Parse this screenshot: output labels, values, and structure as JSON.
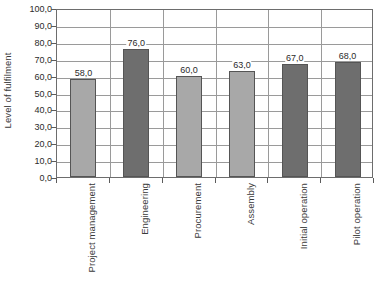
{
  "chart_data": {
    "type": "bar",
    "title": "",
    "xlabel": "",
    "ylabel": "Level of fulfilment",
    "ylim": [
      0,
      100
    ],
    "ytick_step": 10,
    "decimal_separator": ",",
    "grid": "horizontal-and-vertical",
    "legend": "none",
    "categories": [
      "Project management",
      "Engineering",
      "Procurement",
      "Assembly",
      "Initial operation",
      "Pilot operation"
    ],
    "values": [
      58,
      76,
      60,
      63,
      67,
      68
    ],
    "value_labels": [
      "58,0",
      "76,0",
      "60,0",
      "63,0",
      "67,0",
      "68,0"
    ],
    "bar_colors": [
      "#a8a8a8",
      "#6e6e6e",
      "#a8a8a8",
      "#a8a8a8",
      "#6e6e6e",
      "#6e6e6e"
    ],
    "ytick_labels": [
      "100,0",
      "90,0",
      "80,0",
      "70,0",
      "60,0",
      "50,0",
      "40,0",
      "30,0",
      "20,0",
      "10,0",
      "0,0"
    ],
    "ytick_values": [
      100,
      90,
      80,
      70,
      60,
      50,
      40,
      30,
      20,
      10,
      0
    ],
    "colors": {
      "bar_light": "#a8a8a8",
      "bar_dark": "#6e6e6e",
      "bar_outline": "#555555",
      "gridline": "#9a9a9a",
      "frame": "#6d6d6d",
      "text": "#2b2b2b",
      "background": "#ffffff"
    }
  }
}
